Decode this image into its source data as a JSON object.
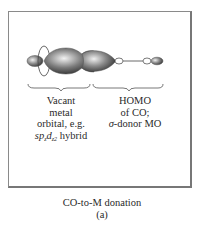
{
  "figure": {
    "left_label": {
      "line1": "Vacant",
      "line2": "metal",
      "line3": "orbital, e.g.",
      "hybrid_sp": "sp",
      "hybrid_sub1": "z",
      "hybrid_d": "d",
      "hybrid_sub2": "z2",
      "hybrid_word": " hybrid"
    },
    "right_label": {
      "line1": "HOMO",
      "line2": "of CO;",
      "sigma": "σ",
      "line3_rest": "-donor MO"
    },
    "caption": {
      "title": "CO-to-M donation",
      "panel": "(a)"
    },
    "colors": {
      "frame": "#8a8a8a",
      "lobe_dark": "#3a3a3a",
      "lobe_light": "#e8e8e8",
      "outline": "#444444"
    }
  }
}
